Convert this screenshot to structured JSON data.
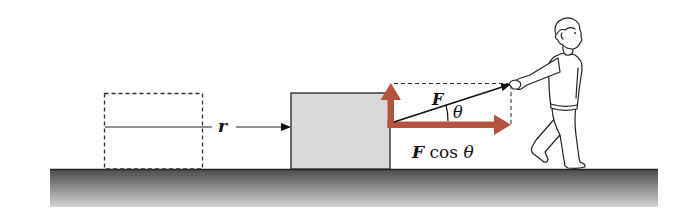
{
  "diagram": {
    "labels": {
      "displacement": "r",
      "force": "F",
      "angle": "θ",
      "horizontal_component_F": "F",
      "horizontal_component_rest": " cos ",
      "horizontal_component_theta": "θ"
    },
    "colors": {
      "component_arrow": "#b5533f",
      "block_fill": "#d9d9d9",
      "ground_top": "#4a4a4a",
      "ground_bottom": "#d0d0d0",
      "line": "#222222"
    },
    "elements": {
      "initial_block": "dashed outline (initial position)",
      "final_block": "solid gray block",
      "force_vector": "F",
      "horizontal_component": "F cos θ",
      "vertical_component": "unlabeled",
      "person": "person pulling rope"
    }
  }
}
